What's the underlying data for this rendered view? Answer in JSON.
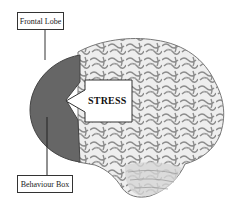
{
  "diagram": {
    "labels": {
      "top": "Frontal Lobe",
      "bottom": "Behaviour Box",
      "arrow": "STRESS"
    },
    "colors": {
      "frontal_lobe_fill": "#666666",
      "brain_base": "#e8e8e8",
      "brain_folds": "#8a8a8a",
      "background": "#ffffff"
    }
  }
}
